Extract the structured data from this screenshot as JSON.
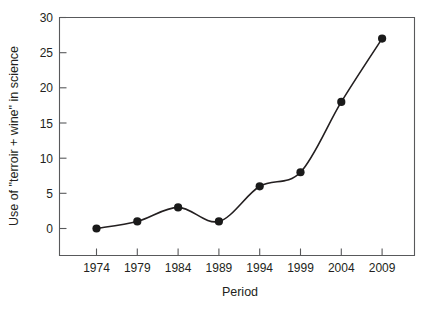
{
  "chart_data": {
    "type": "line",
    "title": "",
    "xlabel": "Period",
    "ylabel": "Use of \"terroir + wine\" in science",
    "categories": [
      "1974",
      "1979",
      "1984",
      "1989",
      "1994",
      "1999",
      "2004",
      "2009"
    ],
    "values": [
      0,
      1,
      3,
      1,
      6,
      8,
      18,
      27
    ],
    "x": [
      1974,
      1979,
      1984,
      1989,
      1994,
      1999,
      2004,
      2009
    ],
    "series": [
      {
        "name": "Use of \"terroir + wine\" in science",
        "values": [
          0,
          1,
          3,
          1,
          6,
          8,
          18,
          27
        ]
      }
    ],
    "ylim": [
      0,
      30
    ],
    "yticks": [
      0,
      5,
      10,
      15,
      20,
      25,
      30
    ],
    "ytick_labels": [
      "0",
      "5",
      "10",
      "15",
      "20",
      "25",
      "30"
    ],
    "xtick_labels": [
      "1974",
      "1979",
      "1984",
      "1989",
      "1994",
      "1999",
      "2004",
      "2009"
    ],
    "grid": false,
    "legend": false,
    "legend_position": "none",
    "line_color": "#231f20",
    "marker_color": "#1a1a1a",
    "marker_shape": "circle",
    "axis_color": "#58595b",
    "background_color": "#ffffff",
    "interpolation": "smooth-spline",
    "tick_direction": "inward"
  },
  "labels": {
    "y_axis_title": "Use of \"terroir + wine\" in science",
    "x_axis_title": "Period",
    "y_tick_30": "30",
    "y_tick_25": "25",
    "y_tick_20": "20",
    "y_tick_15": "15",
    "y_tick_10": "10",
    "y_tick_5": "5",
    "y_tick_0": "0",
    "x_tick_1": "1974",
    "x_tick_2": "1979",
    "x_tick_3": "1984",
    "x_tick_4": "1989",
    "x_tick_5": "1994",
    "x_tick_6": "1999",
    "x_tick_7": "2004",
    "x_tick_8": "2009"
  }
}
